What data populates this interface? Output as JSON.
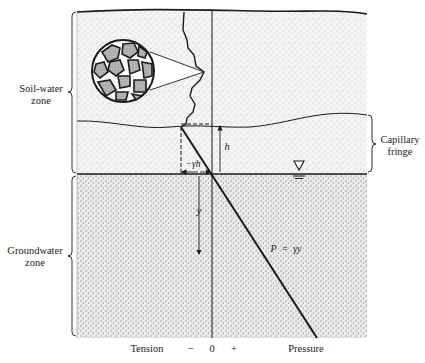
{
  "figure": {
    "zones": {
      "soil_water": {
        "label_line1": "Soil-water",
        "label_line2": "zone"
      },
      "groundwater": {
        "label_line1": "Groundwater",
        "label_line2": "zone"
      },
      "capillary": {
        "label_line1": "Capillary",
        "label_line2": "fringe"
      }
    },
    "annotations": {
      "h": "h",
      "neg_gamma_h": "−γh",
      "y": "y",
      "pressure_eq": "P  =  γy"
    },
    "axis": {
      "tension": "Tension",
      "minus": "−",
      "zero": "0",
      "plus": "+",
      "pressure": "Pressure"
    },
    "symbols": {
      "water_table": "water-table-triangle"
    },
    "colors": {
      "ink": "#1a1a1a",
      "soil_texture": "#9a9a9a",
      "grain_fill": "#a8a8a8"
    }
  }
}
